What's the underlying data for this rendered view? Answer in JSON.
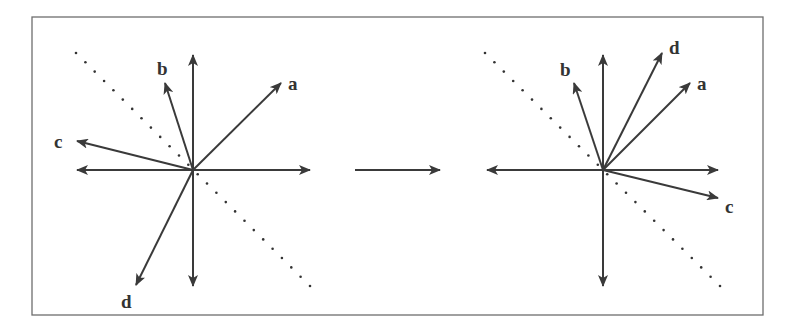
{
  "diagram": {
    "colors": {
      "stroke": "#3a3a3a",
      "frame": "#6e6e6e",
      "dots": "#333333",
      "background": "#ffffff"
    },
    "frame": {
      "x": 32,
      "y": 17,
      "width": 731,
      "height": 298
    },
    "transition_arrow": {
      "x1": 355,
      "y1": 170,
      "x2": 440,
      "y2": 170
    },
    "panels": [
      {
        "id": "before",
        "origin": [
          193,
          170
        ],
        "axes": {
          "left": 77,
          "right": 310,
          "top": 55,
          "bottom": 286
        },
        "dotted_line": {
          "x1": 76,
          "y1": 53,
          "x2": 310,
          "y2": 286
        },
        "vectors": [
          {
            "label": "a",
            "tip": [
              281,
              83
            ],
            "label_pos": [
              288,
              90
            ]
          },
          {
            "label": "b",
            "tip": [
              165,
              83
            ],
            "label_pos": [
              157,
              75
            ]
          },
          {
            "label": "c",
            "tip": [
              77,
              141
            ],
            "label_pos": [
              54,
              148
            ]
          },
          {
            "label": "d",
            "tip": [
              136,
              285
            ],
            "label_pos": [
              121,
              308
            ]
          }
        ]
      },
      {
        "id": "after",
        "origin": [
          603,
          170
        ],
        "axes": {
          "left": 487,
          "right": 718,
          "top": 55,
          "bottom": 286
        },
        "dotted_line": {
          "x1": 485,
          "y1": 53,
          "x2": 720,
          "y2": 286
        },
        "vectors": [
          {
            "label": "a",
            "tip": [
              690,
              83
            ],
            "label_pos": [
              697,
              90
            ]
          },
          {
            "label": "b",
            "tip": [
              574,
              83
            ],
            "label_pos": [
              560,
              76
            ]
          },
          {
            "label": "c",
            "tip": [
              718,
              198
            ],
            "label_pos": [
              725,
              213
            ]
          },
          {
            "label": "d",
            "tip": [
              662,
              53
            ],
            "label_pos": [
              669,
              54
            ]
          }
        ]
      }
    ]
  }
}
